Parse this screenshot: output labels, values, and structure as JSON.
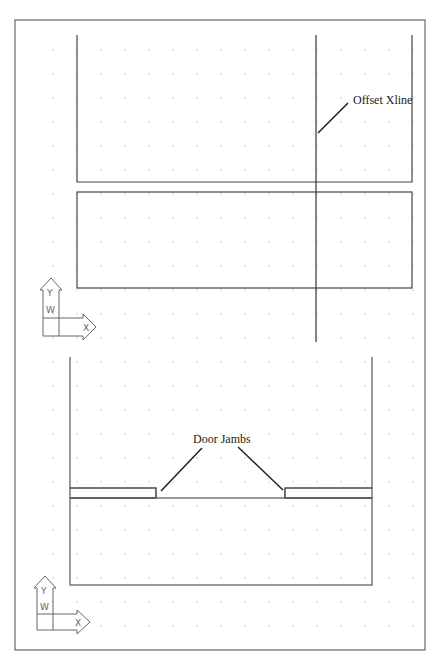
{
  "drawing": {
    "labels": {
      "offset_xline": "Offset Xline",
      "door_jambs": "Door Jambs"
    },
    "ucs_icons": [
      {
        "x_label": "X",
        "y_label": "Y",
        "w_label": "W"
      },
      {
        "x_label": "X",
        "y_label": "Y",
        "w_label": "W"
      }
    ],
    "colors": {
      "line": "#444444",
      "grid_dot": "#b8b8b8",
      "border": "#666666",
      "background": "#ffffff"
    },
    "grid": {
      "spacing_x": 24,
      "spacing_y": 24
    }
  }
}
